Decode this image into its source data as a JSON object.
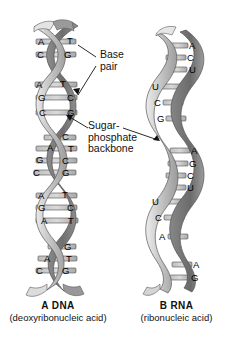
{
  "figure": {
    "background": "#ffffff",
    "ribbon_colors": {
      "front_light": "#d8d8d8",
      "front_mid": "#b4b4b4",
      "back_dark": "#7e7e7e",
      "edge": "#5a5a5a",
      "rung": "#c9c9c9"
    }
  },
  "callouts": [
    {
      "id": "base-pair",
      "line1": "Base",
      "line2": "pair"
    },
    {
      "id": "sugar-phosphate",
      "line1": "Sugar-",
      "line2": "phosphate",
      "line3": "backbone"
    }
  ],
  "dna": {
    "caption_title": "A  DNA",
    "caption_sub": "(deoxyribonucleic acid)",
    "letter": "A",
    "name": "DNA",
    "base_pairs": [
      {
        "left": "A",
        "right": "T",
        "y": 42
      },
      {
        "left": "C",
        "right": "G",
        "y": 55
      },
      {
        "left": "A",
        "right": "T",
        "y": 85
      },
      {
        "left": "G",
        "right": "C",
        "y": 98
      },
      {
        "left": "C",
        "right": "G",
        "y": 113
      },
      {
        "left": "",
        "right": "C",
        "y": 138
      },
      {
        "left": "A",
        "right": "T",
        "y": 149
      },
      {
        "left": "G",
        "right": "C",
        "y": 161
      },
      {
        "left": "C",
        "right": "G",
        "y": 173
      },
      {
        "left": "A",
        "right": "T",
        "y": 196
      },
      {
        "left": "G",
        "right": "C",
        "y": 208
      },
      {
        "left": "A",
        "right": "T",
        "y": 221
      },
      {
        "left": "",
        "right": "G",
        "y": 247
      },
      {
        "left": "A",
        "right": "T",
        "y": 259
      },
      {
        "left": "C",
        "right": "G",
        "y": 271
      }
    ]
  },
  "rna": {
    "caption_title": "B  RNA",
    "caption_sub": "(ribonucleic acid)",
    "letter": "B",
    "name": "RNA",
    "bases": [
      {
        "base": "A",
        "side": "right",
        "y": 46
      },
      {
        "base": "C",
        "side": "right",
        "y": 58
      },
      {
        "base": "U",
        "side": "right",
        "y": 70
      },
      {
        "base": "U",
        "side": "left",
        "y": 87
      },
      {
        "base": "C",
        "side": "left",
        "y": 103
      },
      {
        "base": "G",
        "side": "left",
        "y": 119
      },
      {
        "base": "A",
        "side": "right",
        "y": 151
      },
      {
        "base": "G",
        "side": "right",
        "y": 164
      },
      {
        "base": "C",
        "side": "right",
        "y": 176
      },
      {
        "base": "U",
        "side": "right",
        "y": 188
      },
      {
        "base": "U",
        "side": "left",
        "y": 202
      },
      {
        "base": "C",
        "side": "left",
        "y": 218
      },
      {
        "base": "A",
        "side": "left",
        "y": 237
      },
      {
        "base": "A",
        "side": "right",
        "y": 265
      },
      {
        "base": "G",
        "side": "right",
        "y": 278
      }
    ]
  }
}
